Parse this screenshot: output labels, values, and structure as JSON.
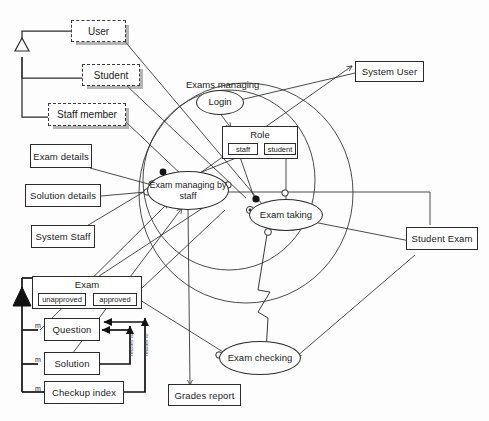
{
  "diagram": {
    "background_color": "#fdfdfd",
    "line_color": "#2b2b2b",
    "boundary_label": "Exams managing"
  },
  "actors": [
    {
      "id": "user",
      "label": "User",
      "style": "dashed"
    },
    {
      "id": "student",
      "label": "Student",
      "style": "dashed"
    },
    {
      "id": "staff_member",
      "label": "Staff member",
      "style": "dashed"
    }
  ],
  "data_boxes": [
    {
      "id": "exam_details",
      "label": "Exam details"
    },
    {
      "id": "solution_details",
      "label": "Solution details"
    },
    {
      "id": "system_staff",
      "label": "System Staff"
    },
    {
      "id": "system_user",
      "label": "System User"
    },
    {
      "id": "student_exam",
      "label": "Student Exam"
    },
    {
      "id": "grades_report",
      "label": "Grades report"
    },
    {
      "id": "question",
      "label": "Question"
    },
    {
      "id": "solution",
      "label": "Solution"
    },
    {
      "id": "checkup_index",
      "label": "Checkup index"
    }
  ],
  "compartment_boxes": [
    {
      "id": "role",
      "title": "Role",
      "chips": [
        {
          "id": "role_staff",
          "label": "staff"
        },
        {
          "id": "role_student",
          "label": "student"
        }
      ]
    },
    {
      "id": "exam",
      "title": "Exam",
      "chips": [
        {
          "id": "exam_unapproved",
          "label": "unapproved"
        },
        {
          "id": "exam_approved",
          "label": "approved"
        }
      ]
    }
  ],
  "use_cases": [
    {
      "id": "login",
      "label": "Login"
    },
    {
      "id": "exam_managing_staff",
      "label": "Exam managing by staff"
    },
    {
      "id": "exam_taking",
      "label": "Exam taking"
    },
    {
      "id": "exam_checking",
      "label": "Exam checking"
    }
  ],
  "multiplicities": [
    {
      "id": "m_question",
      "label": "m"
    },
    {
      "id": "m_solution",
      "label": "m"
    },
    {
      "id": "m_checkup_index",
      "label": "m"
    }
  ],
  "edge_labels": [
    {
      "id": "relates_to_1",
      "label": "relates to"
    },
    {
      "id": "relates_to_2",
      "label": "relates to"
    }
  ]
}
